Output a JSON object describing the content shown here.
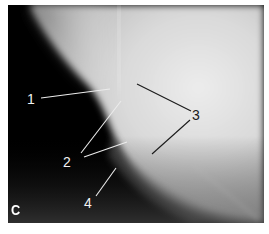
{
  "figure": {
    "panel_letter": "C",
    "type": "radiograph",
    "labels": [
      {
        "id": "1",
        "text": "1",
        "color": "#f2f2f2"
      },
      {
        "id": "2",
        "text": "2",
        "color": "#f2f2f2"
      },
      {
        "id": "3",
        "text": "3",
        "color": "#1a1a1a"
      },
      {
        "id": "4",
        "text": "4",
        "color": "#f2f2f2"
      }
    ]
  },
  "colors": {
    "background_dark": "#000000",
    "bone_bright": "#e6e6e6",
    "leader_light": "#e8e8e8",
    "leader_dark": "#1a1a1a",
    "page": "#ffffff"
  }
}
